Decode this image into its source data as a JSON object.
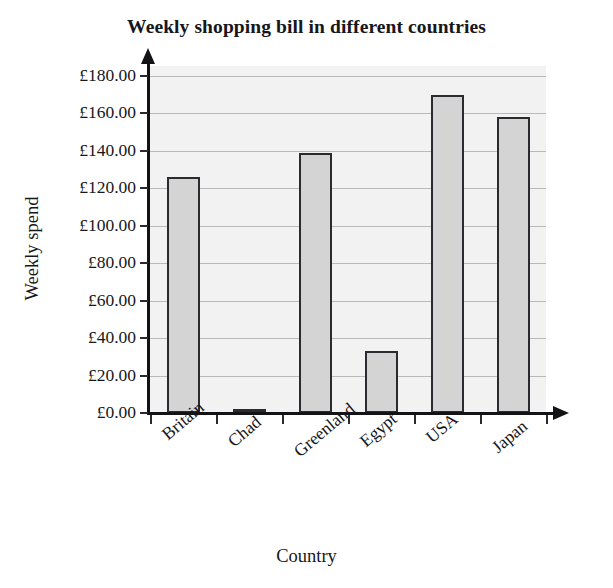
{
  "chart_data": {
    "type": "bar",
    "title": "Weekly shopping bill in different countries",
    "xlabel": "Country",
    "ylabel": "Weekly spend",
    "categories": [
      "Britain",
      "Chad",
      "Greenland",
      "Egypt",
      "USA",
      "Japan"
    ],
    "values": [
      126,
      2,
      139,
      33,
      170,
      158
    ],
    "ylim": [
      0,
      180
    ],
    "ytick_step": 20,
    "ytick_labels": [
      "£180.00",
      "£160.00",
      "£140.00",
      "£120.00",
      "£100.00",
      "£80.00",
      "£60.00",
      "£40.00",
      "£20.00",
      "£0.00"
    ],
    "ytick_values": [
      180,
      160,
      140,
      120,
      100,
      80,
      60,
      40,
      20,
      0
    ],
    "currency_symbol": "£",
    "grid": true,
    "legend": false,
    "legend_position": "none",
    "bar_fill_color": "#d4d4d4",
    "bar_border_color": "#2b2b2f",
    "plot_background_color": "#f2f2f2",
    "axis_color": "#131316",
    "text_color": "#17161a",
    "xtick_label_rotation": -40
  }
}
